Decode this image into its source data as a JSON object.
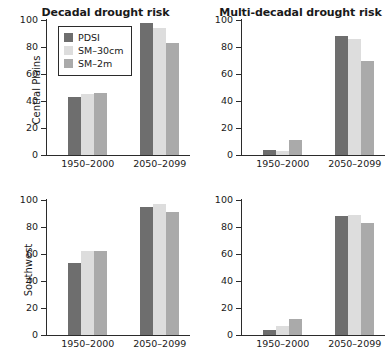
{
  "chart_data": {
    "type": "bar",
    "title": "",
    "panels": [
      {
        "row_label": "Central Plains",
        "col_title": "Decadal drought risk",
        "categories": [
          "1950–2000",
          "2050–2099"
        ],
        "series": [
          {
            "name": "PDSI",
            "values": [
              43,
              98
            ]
          },
          {
            "name": "SM–30cm",
            "values": [
              45,
              94
            ]
          },
          {
            "name": "SM–2m",
            "values": [
              46,
              83
            ]
          }
        ],
        "ylim": [
          0,
          100
        ],
        "yticks": [
          0,
          20,
          40,
          60,
          80,
          100
        ],
        "has_legend": true
      },
      {
        "row_label": "Central Plains",
        "col_title": "Multi-decadal drought risk",
        "categories": [
          "1950–2000",
          "2050–2099"
        ],
        "series": [
          {
            "name": "PDSI",
            "values": [
              4,
              88
            ]
          },
          {
            "name": "SM–30cm",
            "values": [
              3,
              86
            ]
          },
          {
            "name": "SM–2m",
            "values": [
              11,
              70
            ]
          }
        ],
        "ylim": [
          0,
          100
        ],
        "yticks": [
          0,
          20,
          40,
          60,
          80,
          100
        ],
        "has_legend": false
      },
      {
        "row_label": "Southwest",
        "col_title": "",
        "categories": [
          "1950–2000",
          "2050–2099"
        ],
        "series": [
          {
            "name": "PDSI",
            "values": [
              53,
              95
            ]
          },
          {
            "name": "SM–30cm",
            "values": [
              62,
              97
            ]
          },
          {
            "name": "SM–2m",
            "values": [
              62,
              91
            ]
          }
        ],
        "ylim": [
          0,
          100
        ],
        "yticks": [
          0,
          20,
          40,
          60,
          80,
          100
        ],
        "has_legend": false
      },
      {
        "row_label": "Southwest",
        "col_title": "",
        "categories": [
          "1950–2000",
          "2050–2099"
        ],
        "series": [
          {
            "name": "PDSI",
            "values": [
              4,
              88
            ]
          },
          {
            "name": "SM–30cm",
            "values": [
              7,
              89
            ]
          },
          {
            "name": "SM–2m",
            "values": [
              12,
              83
            ]
          }
        ],
        "ylim": [
          0,
          100
        ],
        "yticks": [
          0,
          20,
          40,
          60,
          80,
          100
        ],
        "has_legend": false
      }
    ],
    "xlabel": "",
    "ylabel": "",
    "grid": false,
    "legend_position": "upper-left of first panel",
    "colors": {
      "PDSI": "#6e6e6e",
      "SM–30cm": "#dddddd",
      "SM–2m": "#aaaaaa",
      "axis": "#2b2b2b",
      "background": "#ffffff"
    }
  },
  "legend": {
    "items": [
      {
        "label": "PDSI",
        "color": "#6e6e6e"
      },
      {
        "label": "SM–30cm",
        "color": "#dddddd"
      },
      {
        "label": "SM–2m",
        "color": "#aaaaaa"
      }
    ]
  },
  "titles": {
    "left_column": "Decadal drought risk",
    "right_column": "Multi-decadal drought risk"
  },
  "row_labels": {
    "top": "Central Plains",
    "bottom": "Southwest"
  }
}
